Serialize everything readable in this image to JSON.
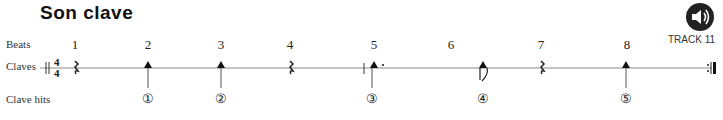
{
  "title": "Son clave",
  "rows": {
    "beats": "Beats",
    "claves": "Claves",
    "clave_hits": "Clave hits"
  },
  "time_signature": "4/4",
  "beats": [
    "1",
    "2",
    "3",
    "4",
    "5",
    "6",
    "7",
    "8"
  ],
  "hits": [
    "①",
    "②",
    "③",
    "④",
    "⑤"
  ],
  "track": {
    "icon": "speaker-icon",
    "label": "TRACK 11"
  }
}
